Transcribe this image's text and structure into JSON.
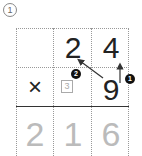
{
  "problem": {
    "number_label": "①",
    "multiplicand": [
      "2",
      "4"
    ],
    "operator": "×",
    "multiplier": "9",
    "carry": "3",
    "product": [
      "2",
      "1",
      "6"
    ],
    "steps": [
      "❶",
      "❷"
    ]
  }
}
